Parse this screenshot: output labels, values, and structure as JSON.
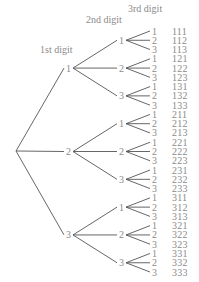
{
  "headers": {
    "first": "1st digit",
    "second": "2nd digit",
    "third": "3rd digit"
  },
  "tree": {
    "root": {
      "x": 16,
      "y": 151
    },
    "first_digits": [
      "1",
      "2",
      "3"
    ],
    "second_digits": [
      "1",
      "2",
      "3"
    ],
    "third_digits": [
      "1",
      "2",
      "3"
    ]
  },
  "outcomes": [
    "111",
    "112",
    "113",
    "121",
    "122",
    "123",
    "131",
    "132",
    "133",
    "211",
    "212",
    "213",
    "221",
    "222",
    "223",
    "231",
    "232",
    "233",
    "311",
    "312",
    "313",
    "321",
    "322",
    "323",
    "331",
    "332",
    "333"
  ],
  "colors": {
    "text": "#8a8a8a",
    "line": "#555555"
  }
}
